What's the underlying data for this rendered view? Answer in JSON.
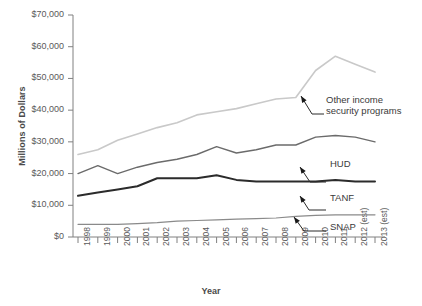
{
  "chart_data": {
    "type": "line",
    "title": "",
    "xlabel": "Year",
    "ylabel": "Millions of Dollars",
    "ylim": [
      0,
      70000
    ],
    "ytick_labels": [
      "$70,000",
      "$60,000",
      "$50,000",
      "$40,000",
      "$30,000",
      "$20,000",
      "$10,000",
      "$0"
    ],
    "ytick_values": [
      70000,
      60000,
      50000,
      40000,
      30000,
      20000,
      10000,
      0
    ],
    "grid": false,
    "legend_position": "inline-annotations",
    "categories": [
      "1998",
      "1999",
      "2000",
      "2001",
      "2002",
      "2003",
      "2004",
      "2005",
      "2006",
      "2007",
      "2008",
      "2009",
      "2010",
      "2011",
      "2012 (est)",
      "2013 (est)"
    ],
    "series": [
      {
        "name": "Other income security programs",
        "color": "#c9c9c9",
        "values": [
          26000,
          27500,
          30500,
          32500,
          34500,
          36000,
          38500,
          39500,
          40500,
          42000,
          43500,
          44000,
          52500,
          57000,
          54500,
          52000
        ]
      },
      {
        "name": "HUD",
        "color": "#6b6b6b",
        "values": [
          20000,
          22500,
          20000,
          22000,
          23500,
          24500,
          26000,
          28500,
          26500,
          27500,
          29000,
          29000,
          31500,
          32000,
          31500,
          30000
        ]
      },
      {
        "name": "TANF",
        "color": "#2b2b2b",
        "values": [
          13000,
          14000,
          15000,
          16000,
          18500,
          18500,
          18500,
          19500,
          18000,
          17500,
          17500,
          17500,
          17500,
          18000,
          17500,
          17500
        ]
      },
      {
        "name": "SNAP",
        "color": "#8a8a8a",
        "values": [
          4000,
          4000,
          4000,
          4200,
          4500,
          5000,
          5200,
          5400,
          5600,
          5800,
          6000,
          6500,
          6800,
          7000,
          7000,
          7000
        ]
      }
    ],
    "annotations": [
      {
        "label": "Other income\nsecurity programs",
        "series": "Other income security programs"
      },
      {
        "label": "HUD",
        "series": "HUD"
      },
      {
        "label": "TANF",
        "series": "TANF"
      },
      {
        "label": "SNAP",
        "series": "SNAP"
      }
    ]
  },
  "annotation_labels": {
    "other_line1": "Other income",
    "other_line2": "security programs",
    "hud": "HUD",
    "tanf": "TANF",
    "snap": "SNAP"
  },
  "axis": {
    "y_title": "Millions of Dollars",
    "x_title": "Year"
  }
}
